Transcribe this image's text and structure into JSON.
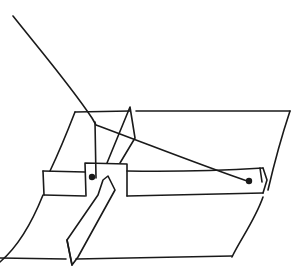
{
  "diagram": {
    "title": "",
    "ink_color": "#1a1a1a",
    "background": "#ffffff",
    "parts": [
      {
        "id": "string",
        "label": ""
      },
      {
        "id": "tray",
        "label": ""
      },
      {
        "id": "band",
        "label": ""
      },
      {
        "id": "tab",
        "label": ""
      },
      {
        "id": "strip",
        "label": ""
      },
      {
        "id": "pin-left",
        "label": ""
      },
      {
        "id": "pin-right",
        "label": ""
      }
    ]
  }
}
